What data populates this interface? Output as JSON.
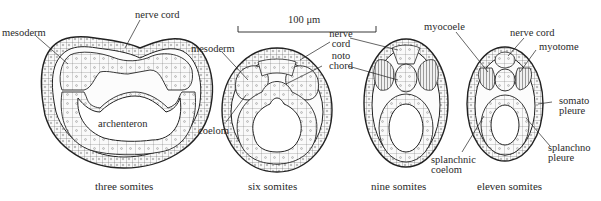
{
  "figure": {
    "scale_bar": "100 μm",
    "panels": [
      {
        "caption": "three somites",
        "labels": [
          "mesoderm",
          "nerve cord",
          "archenteron"
        ]
      },
      {
        "caption": "six somites",
        "labels": [
          "mesoderm",
          "nerve cord",
          "noto chord",
          "coelom"
        ]
      },
      {
        "caption": "nine somites",
        "labels": []
      },
      {
        "caption": "eleven somites",
        "labels": [
          "myocoele",
          "nerve cord",
          "myotome",
          "somato pleure",
          "splanchno pleure",
          "splanchnic coelom"
        ]
      }
    ]
  },
  "labels": {
    "p1_mesoderm": "mesoderm",
    "p1_nerve_cord": "nerve cord",
    "p1_archenteron": "archenteron",
    "p2_mesoderm": "mesoderm",
    "p2_coelom": "coelom",
    "p2_nerve": "nerve",
    "p2_cord": "cord",
    "p2_noto": "noto",
    "p2_chord": "chord",
    "p4_myocoele": "myocoele",
    "p4_nerve_cord": "nerve cord",
    "p4_myotome": "myotome",
    "p4_somato": "somato",
    "p4_somato_pleure": "pleure",
    "p4_splanchno": "splanchno",
    "p4_splanchno_pleure": "pleure",
    "p4_splanchnic": "splanchnic",
    "p4_splanchnic_coelom": "coelom",
    "scale": "100 μm"
  },
  "captions": {
    "three": "three somites",
    "six": "six somites",
    "nine": "nine somites",
    "eleven": "eleven somites"
  }
}
